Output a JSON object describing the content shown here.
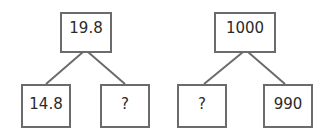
{
  "trees": [
    {
      "root": "19.8",
      "left": "14.8",
      "right": "?"
    },
    {
      "root": "1000",
      "left": "?",
      "right": "990"
    }
  ],
  "colors": {
    "line": "#6b6b6b",
    "text": "#2a2a2a"
  }
}
